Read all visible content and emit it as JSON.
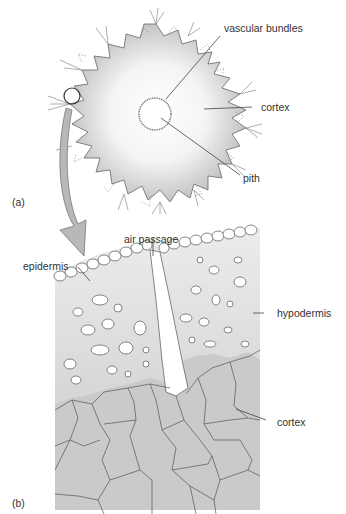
{
  "figure": {
    "panels": [
      {
        "id": "a",
        "label": "(a)",
        "description": "Transverse section of stem, whole view",
        "callouts": [
          "vascular bundles",
          "cortex",
          "pith"
        ]
      },
      {
        "id": "b",
        "label": "(b)",
        "description": "Enlarged detail of outer stem region",
        "callouts": [
          "air passage",
          "epidermis",
          "hypodermis",
          "cortex"
        ]
      }
    ],
    "labels": {
      "vascular_bundles": "vascular bundles",
      "cortex_a": "cortex",
      "pith": "pith",
      "panel_a": "(a)",
      "air_passage": "air passage",
      "epidermis": "epidermis",
      "hypodermis": "hypodermis",
      "cortex_b": "cortex",
      "panel_b": "(b)"
    },
    "colors": {
      "tissue_gradient_edge": "#c8c8c8",
      "tissue_center": "#ffffff",
      "hypodermis_fill": "#dedede",
      "cortex_fill": "#c9c9c9",
      "outline": "#555555",
      "arrow_fill": "#b5b5b5"
    }
  }
}
